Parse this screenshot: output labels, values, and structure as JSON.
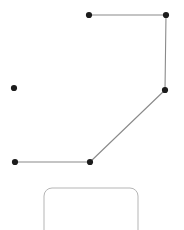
{
  "canvas": {
    "width": 184,
    "height": 230,
    "background_color": "#ffffff"
  },
  "style": {
    "node_color": "#1c1c1c",
    "node_radius": 3.1,
    "edge_color": "#8a8a8a",
    "edge_width": 1.1,
    "panel_outline_color": "#b5b5b5",
    "panel_outline_width": 1.0,
    "panel_corner_radius": 8
  },
  "nodes": [
    {
      "id": "n1",
      "name": "node-top-left",
      "x": 89,
      "y": 15
    },
    {
      "id": "n2",
      "name": "node-top-right",
      "x": 166,
      "y": 15
    },
    {
      "id": "n3",
      "name": "node-mid-right",
      "x": 165,
      "y": 90
    },
    {
      "id": "n4",
      "name": "node-isolated-left",
      "x": 14,
      "y": 88
    },
    {
      "id": "n5",
      "name": "node-bottom-left",
      "x": 15,
      "y": 162
    },
    {
      "id": "n6",
      "name": "node-bottom-corner",
      "x": 90,
      "y": 162
    }
  ],
  "edges": [
    {
      "id": "e1",
      "name": "edge-top-horizontal",
      "x1": 89,
      "y1": 15,
      "x2": 166,
      "y2": 15
    },
    {
      "id": "e2",
      "name": "edge-right-vertical",
      "x1": 166,
      "y1": 15,
      "x2": 165,
      "y2": 90
    },
    {
      "id": "e3",
      "name": "edge-diagonal",
      "x1": 165,
      "y1": 90,
      "x2": 90,
      "y2": 162
    },
    {
      "id": "e4",
      "name": "edge-bottom-horizontal",
      "x1": 15,
      "y1": 162,
      "x2": 90,
      "y2": 162
    }
  ],
  "panel": {
    "name": "rounded-panel",
    "x": 44,
    "y": 188,
    "width": 94,
    "height": 60,
    "corner_radius": 8,
    "clipped_at_bottom": true
  }
}
